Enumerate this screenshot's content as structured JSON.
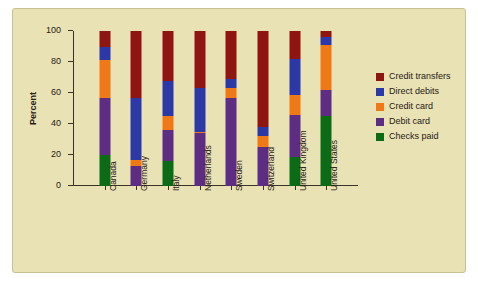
{
  "chart_data": {
    "type": "bar",
    "subtype": "stacked-vertical-100pct",
    "title": "",
    "xlabel": "",
    "ylabel": "Percent",
    "ylim": [
      0,
      100
    ],
    "yticks": [
      0,
      20,
      40,
      60,
      80,
      100
    ],
    "ytick_labels": [
      "0",
      "20",
      "40",
      "60",
      "80",
      "100"
    ],
    "grid": false,
    "legend_position": "right",
    "categories": [
      "Canada",
      "Germany",
      "Italy",
      "Netherlands",
      "Sweden",
      "Switzerland",
      "United Kingdom",
      "United States"
    ],
    "series": [
      {
        "name": "Checks paid",
        "color": "#0b6b16",
        "values": [
          20,
          0,
          16,
          0,
          0,
          0,
          19,
          45
        ]
      },
      {
        "name": "Debit card",
        "color": "#5c2d83",
        "values": [
          37,
          13,
          20,
          34,
          57,
          25,
          27,
          17
        ]
      },
      {
        "name": "Credit card",
        "color": "#f07817",
        "values": [
          24,
          4,
          9,
          1,
          6,
          7,
          13,
          29
        ]
      },
      {
        "name": "Direct debits",
        "color": "#2c38a8",
        "values": [
          9,
          40,
          23,
          28,
          6,
          6,
          23,
          5
        ]
      },
      {
        "name": "Credit transfers",
        "color": "#8e1512",
        "values": [
          10,
          43,
          32,
          37,
          31,
          62,
          18,
          4
        ]
      }
    ],
    "stack_order_bottom_to_top": [
      "Checks paid",
      "Debit card",
      "Credit card",
      "Direct debits",
      "Credit transfers"
    ]
  },
  "legend": {
    "items": [
      {
        "label": "Credit transfers",
        "color": "#8e1512"
      },
      {
        "label": "Direct debits",
        "color": "#2c38a8"
      },
      {
        "label": "Credit card",
        "color": "#f07817"
      },
      {
        "label": "Debit card",
        "color": "#5c2d83"
      },
      {
        "label": "Checks paid",
        "color": "#0b6b16"
      }
    ]
  },
  "figure": {
    "background_color": "#e9e2b4",
    "axis_color": "#3a3326",
    "text_color": "#272014"
  }
}
